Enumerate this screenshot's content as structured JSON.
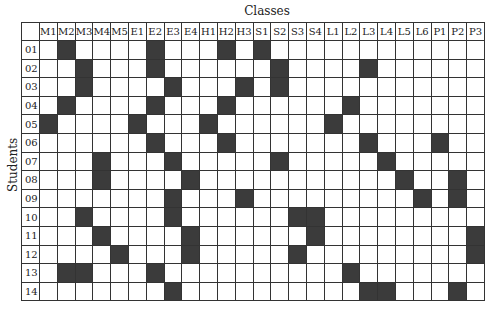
{
  "title": "Classes",
  "ylabel": "Students",
  "colors": {
    "filled": "#3b3b3b",
    "empty": "#ffffff",
    "border": "#333333"
  },
  "columns": [
    "M1",
    "M2",
    "M3",
    "M4",
    "M5",
    "E1",
    "E2",
    "E3",
    "E4",
    "H1",
    "H2",
    "H3",
    "S1",
    "S2",
    "S3",
    "S4",
    "L1",
    "L2",
    "L3",
    "L4",
    "L5",
    "L6",
    "P1",
    "P2",
    "P3"
  ],
  "rows": [
    {
      "label": "01",
      "filled": [
        "M2",
        "E2",
        "H2",
        "S1"
      ]
    },
    {
      "label": "02",
      "filled": [
        "M3",
        "E2",
        "S2",
        "L3"
      ]
    },
    {
      "label": "03",
      "filled": [
        "M3",
        "E3",
        "H3",
        "S2"
      ]
    },
    {
      "label": "04",
      "filled": [
        "M2",
        "E2",
        "H2",
        "L2"
      ]
    },
    {
      "label": "05",
      "filled": [
        "M1",
        "E1",
        "H1",
        "L1"
      ]
    },
    {
      "label": "06",
      "filled": [
        "E2",
        "H2",
        "L3",
        "P1"
      ]
    },
    {
      "label": "07",
      "filled": [
        "M4",
        "E3",
        "S2",
        "L4"
      ]
    },
    {
      "label": "08",
      "filled": [
        "M4",
        "E4",
        "L5",
        "P2"
      ]
    },
    {
      "label": "09",
      "filled": [
        "E3",
        "H3",
        "L6",
        "P2"
      ]
    },
    {
      "label": "10",
      "filled": [
        "M3",
        "E3",
        "S3",
        "S4"
      ]
    },
    {
      "label": "11",
      "filled": [
        "M4",
        "E4",
        "S4",
        "P3"
      ]
    },
    {
      "label": "12",
      "filled": [
        "M5",
        "E4",
        "S3",
        "P3"
      ]
    },
    {
      "label": "13",
      "filled": [
        "M2",
        "M3",
        "E2",
        "L2"
      ]
    },
    {
      "label": "14",
      "filled": [
        "E3",
        "L3",
        "L4",
        "P2"
      ]
    }
  ]
}
